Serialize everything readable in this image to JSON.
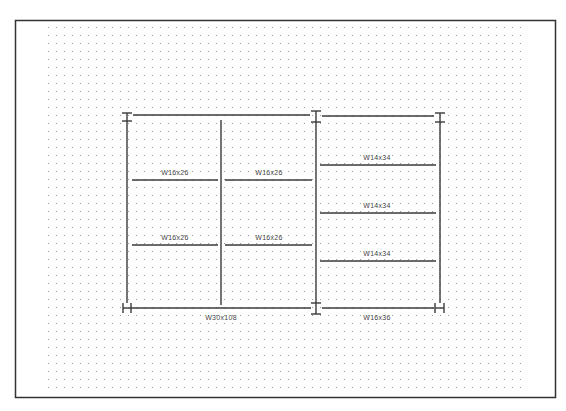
{
  "drawing": {
    "type": "structural-framing-plan",
    "colors": {
      "background": "#ffffff",
      "border": "#333333",
      "grid_dot": "#9a9a9a",
      "member": "#3a3a3a",
      "label": "#444444"
    },
    "columns": [
      {
        "id": "C-top-left",
        "symbol": "I"
      },
      {
        "id": "C-top-middle",
        "symbol": "I"
      },
      {
        "id": "C-top-right",
        "symbol": "I"
      },
      {
        "id": "C-bottom-left",
        "symbol": "H"
      },
      {
        "id": "C-bottom-middle",
        "symbol": "I"
      },
      {
        "id": "C-bottom-right",
        "symbol": "H"
      }
    ],
    "girders": [
      {
        "id": "G-bottom-left-bay",
        "label": "W30x108"
      },
      {
        "id": "G-bottom-right-bay",
        "label": "W16x36"
      }
    ],
    "beams": {
      "left_bay_row1_left": "W16x26",
      "left_bay_row1_right": "W16x26",
      "left_bay_row2_left": "W16x26",
      "left_bay_row2_right": "W16x26",
      "right_bay_row1": "W14x34",
      "right_bay_row2": "W14x34",
      "right_bay_row3": "W14x34"
    }
  }
}
